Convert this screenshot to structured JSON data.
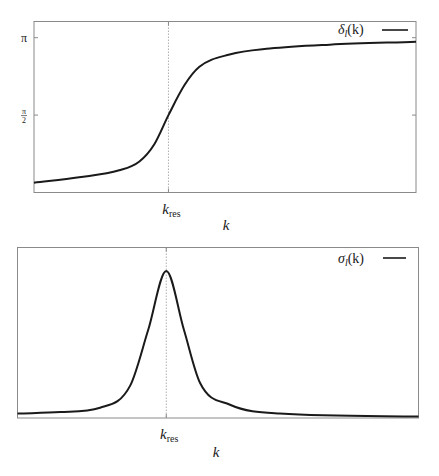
{
  "chart_data": [
    {
      "type": "line",
      "panel": "top",
      "title": "",
      "xlabel": "k",
      "ylabel": "",
      "x_ticks": [
        {
          "value": 0.352,
          "label_main": "k",
          "label_sub": "res"
        }
      ],
      "y_ticks": [
        {
          "value": 3.14159,
          "label": "π"
        },
        {
          "value": 1.5708,
          "label_num": "π",
          "label_den": "2"
        }
      ],
      "xlim": [
        0,
        1
      ],
      "ylim": [
        0,
        3.47
      ],
      "grid": false,
      "legend": {
        "position": "top-right",
        "entries": [
          {
            "main": "δ",
            "sub": "l",
            "rest": "(k)"
          }
        ]
      },
      "reference_line_x": 0.352,
      "series": [
        {
          "name": "δ_l(k)",
          "x": [
            0,
            0.118,
            0.223,
            0.276,
            0.315,
            0.352,
            0.394,
            0.433,
            0.512,
            0.617,
            0.774,
            1.0
          ],
          "values": [
            0.2,
            0.31,
            0.45,
            0.63,
            0.98,
            1.57,
            2.18,
            2.55,
            2.8,
            2.92,
            3.0,
            3.06
          ]
        }
      ]
    },
    {
      "type": "line",
      "panel": "bottom",
      "title": "",
      "xlabel": "k",
      "ylabel": "",
      "x_ticks": [
        {
          "value": 0.371,
          "label_main": "k",
          "label_sub": "res"
        }
      ],
      "y_ticks": [],
      "xlim": [
        0,
        1
      ],
      "ylim": [
        0,
        1.16
      ],
      "grid": false,
      "legend": {
        "position": "top-right",
        "entries": [
          {
            "main": "σ",
            "sub": "l",
            "rest": "(k)"
          }
        ]
      },
      "reference_line_x": 0.371,
      "series": [
        {
          "name": "σ_l(k)",
          "x": [
            0,
            0.107,
            0.206,
            0.281,
            0.326,
            0.371,
            0.415,
            0.455,
            0.53,
            0.654,
            1.0
          ],
          "values": [
            0.03,
            0.04,
            0.07,
            0.22,
            0.6,
            1.0,
            0.6,
            0.24,
            0.09,
            0.03,
            0.01
          ]
        }
      ]
    }
  ]
}
